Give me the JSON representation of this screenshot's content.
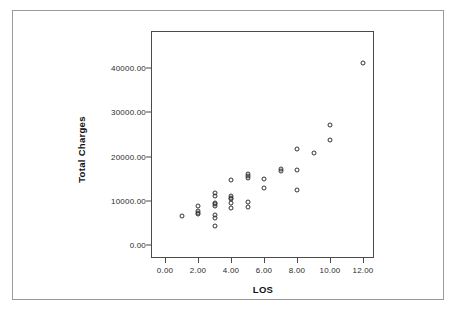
{
  "chart_data": {
    "type": "scatter",
    "title": "",
    "xlabel": "LOS",
    "ylabel": "Total Charges",
    "xlim": [
      -0.6,
      12.6
    ],
    "ylim": [
      -2000,
      45000
    ],
    "grid": false,
    "legend": null,
    "marker": "open-circle",
    "xticks": [
      "0.00",
      "2.00",
      "4.00",
      "6.00",
      "8.00",
      "10.00",
      "12.00"
    ],
    "xtick_values": [
      0,
      2,
      4,
      6,
      8,
      10,
      12
    ],
    "yticks": [
      "0.00",
      "10000.00",
      "20000.00",
      "30000.00",
      "40000.00"
    ],
    "ytick_values": [
      0,
      10000,
      20000,
      30000,
      40000
    ],
    "points": [
      {
        "x": 1,
        "y": 6600
      },
      {
        "x": 2,
        "y": 8800
      },
      {
        "x": 2,
        "y": 7600
      },
      {
        "x": 2,
        "y": 7300
      },
      {
        "x": 2,
        "y": 7100
      },
      {
        "x": 3,
        "y": 11800
      },
      {
        "x": 3,
        "y": 11100
      },
      {
        "x": 3,
        "y": 9600
      },
      {
        "x": 3,
        "y": 9200
      },
      {
        "x": 3,
        "y": 8900
      },
      {
        "x": 3,
        "y": 6700
      },
      {
        "x": 3,
        "y": 6200
      },
      {
        "x": 3,
        "y": 4300
      },
      {
        "x": 4,
        "y": 14800
      },
      {
        "x": 4,
        "y": 11100
      },
      {
        "x": 4,
        "y": 10700
      },
      {
        "x": 4,
        "y": 10400
      },
      {
        "x": 4,
        "y": 9500
      },
      {
        "x": 4,
        "y": 8300
      },
      {
        "x": 5,
        "y": 16000
      },
      {
        "x": 5,
        "y": 15500
      },
      {
        "x": 5,
        "y": 15200
      },
      {
        "x": 5,
        "y": 9700
      },
      {
        "x": 5,
        "y": 8600
      },
      {
        "x": 6,
        "y": 14900
      },
      {
        "x": 6,
        "y": 12800
      },
      {
        "x": 7,
        "y": 17200
      },
      {
        "x": 7,
        "y": 16800
      },
      {
        "x": 8,
        "y": 21700
      },
      {
        "x": 8,
        "y": 16900
      },
      {
        "x": 8,
        "y": 12400
      },
      {
        "x": 9,
        "y": 20700
      },
      {
        "x": 10,
        "y": 27100
      },
      {
        "x": 10,
        "y": 23700
      },
      {
        "x": 12,
        "y": 41200
      }
    ]
  },
  "axes": {
    "x_label": "LOS",
    "y_label": "Total Charges"
  },
  "colors": {
    "marker_stroke": "#333333",
    "axis": "#4a4a4a",
    "outer_border": "#9a9a9a",
    "background": "#ffffff",
    "text": "#111111"
  }
}
